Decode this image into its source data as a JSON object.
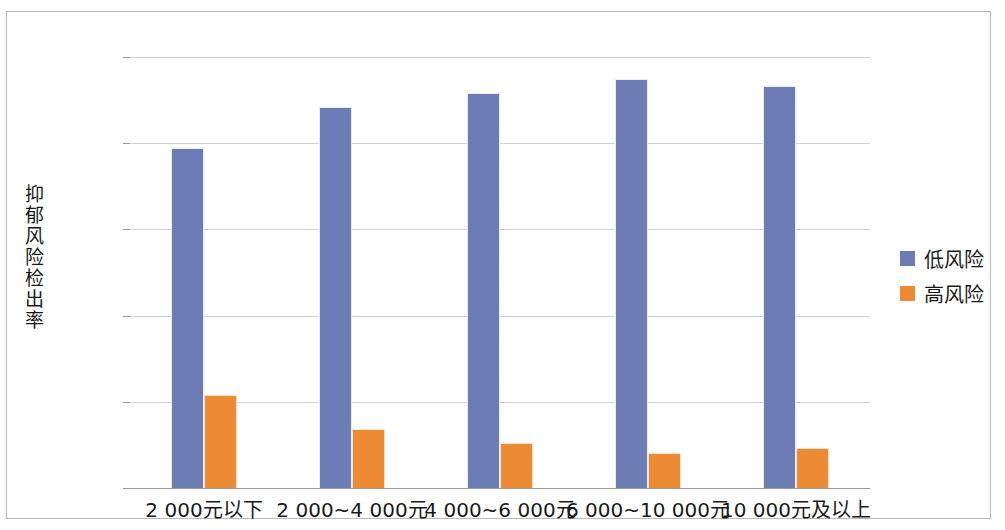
{
  "chart_data": {
    "type": "bar",
    "title": "",
    "xlabel": "",
    "ylabel": "抑郁风险检出率",
    "ylim": [
      0,
      100
    ],
    "ytick_labels": [
      "100%",
      "80%",
      "60%",
      "40%",
      "20%",
      "0%"
    ],
    "ytick_values": [
      100,
      80,
      60,
      40,
      20,
      0
    ],
    "grid": true,
    "legend_position": "right",
    "categories": [
      "2 000元以下",
      "2 000~4 000元",
      "4 000~6 000元",
      "6 000~10 000元",
      "10 000元及以上"
    ],
    "series": [
      {
        "name": "低风险",
        "color": "#6c7db5",
        "values": [
          79.0,
          88.4,
          91.6,
          94.9,
          93.3
        ]
      },
      {
        "name": "高风险",
        "color": "#ed8b35",
        "values": [
          21.5,
          13.7,
          10.4,
          8.1,
          9.3
        ]
      }
    ]
  },
  "legend": {
    "items": [
      {
        "label": "低风险",
        "color": "#6c7db5"
      },
      {
        "label": "高风险",
        "color": "#ed8b35"
      }
    ]
  },
  "axis": {
    "y_title_chars": [
      "抑",
      "郁",
      "风",
      "险",
      "检",
      "出",
      "率"
    ]
  }
}
